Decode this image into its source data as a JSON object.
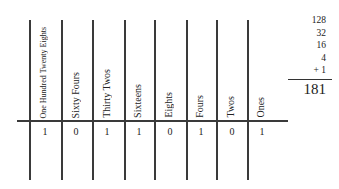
{
  "diagram": {
    "title": "",
    "columns": [
      {
        "label": "One Hundred Twenty Eights",
        "digit": "1",
        "x": 29
      },
      {
        "label": "Sixty Fours",
        "digit": "0",
        "x": 61
      },
      {
        "label": "Thirty Twos",
        "digit": "1",
        "x": 92
      },
      {
        "label": "Sixteens",
        "digit": "1",
        "x": 124
      },
      {
        "label": "Eights",
        "digit": "0",
        "x": 154
      },
      {
        "label": "Fours",
        "digit": "1",
        "x": 186
      },
      {
        "label": "Twos",
        "digit": "0",
        "x": 216
      },
      {
        "label": "Ones",
        "digit": "1",
        "x": 247
      }
    ],
    "addition": {
      "addends": [
        "128",
        "32",
        "16",
        "4",
        "+ 1"
      ],
      "total": "181"
    }
  }
}
